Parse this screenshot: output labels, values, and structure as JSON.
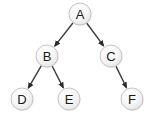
{
  "diagram": {
    "type": "tree",
    "background_color": "#ffffff",
    "node_fill_color": "#f2f2f2",
    "node_stroke_color": "#b8b8b8",
    "edge_color": "#3a3a3a",
    "label_color": "#1a1a1a",
    "node_radius": 11,
    "nodes": [
      {
        "id": "A",
        "label": "A",
        "x": 80,
        "y": 14,
        "level": 0
      },
      {
        "id": "B",
        "label": "B",
        "x": 47,
        "y": 56,
        "level": 1
      },
      {
        "id": "C",
        "label": "C",
        "x": 111,
        "y": 56,
        "level": 1
      },
      {
        "id": "D",
        "label": "D",
        "x": 22,
        "y": 99,
        "level": 2
      },
      {
        "id": "E",
        "label": "E",
        "x": 69,
        "y": 99,
        "level": 2
      },
      {
        "id": "F",
        "label": "F",
        "x": 132,
        "y": 99,
        "level": 2
      }
    ],
    "edges": [
      {
        "from": "A",
        "to": "B",
        "directed": true
      },
      {
        "from": "A",
        "to": "C",
        "directed": true
      },
      {
        "from": "B",
        "to": "D",
        "directed": true
      },
      {
        "from": "B",
        "to": "E",
        "directed": true
      },
      {
        "from": "C",
        "to": "F",
        "directed": true
      }
    ]
  }
}
